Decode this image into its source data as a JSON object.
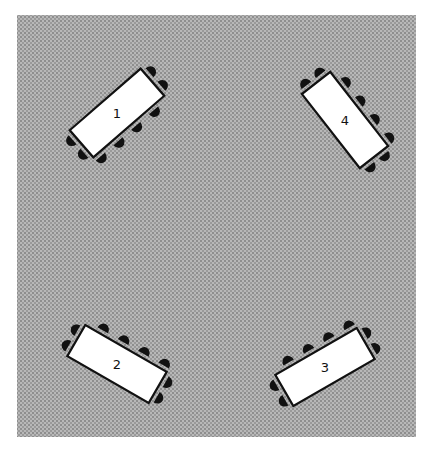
{
  "diagram": {
    "title": "",
    "room": {
      "floor_color": "#a9a9a9",
      "background_color": "#ffffff"
    },
    "tables": [
      {
        "label": "1",
        "position": "top-left",
        "orientation": "diagonal rising to upper-right",
        "chairs_long_side": 4,
        "chairs_each_end": 2,
        "chair_long_side": "lower-right"
      },
      {
        "label": "2",
        "position": "bottom-left",
        "orientation": "diagonal falling to lower-right",
        "chairs_long_side": 4,
        "chairs_each_end": 2,
        "chair_long_side": "upper-right"
      },
      {
        "label": "3",
        "position": "bottom-right",
        "orientation": "diagonal rising to upper-right",
        "chairs_long_side": 4,
        "chairs_each_end": 2,
        "chair_long_side": "upper-left"
      },
      {
        "label": "4",
        "position": "top-right",
        "orientation": "diagonal falling to lower-right",
        "chairs_long_side": 4,
        "chairs_each_end": 2,
        "chair_long_side": "upper-left"
      }
    ],
    "colors": {
      "table_fill": "#ffffff",
      "outline": "#111111",
      "chair": "#111111"
    }
  }
}
